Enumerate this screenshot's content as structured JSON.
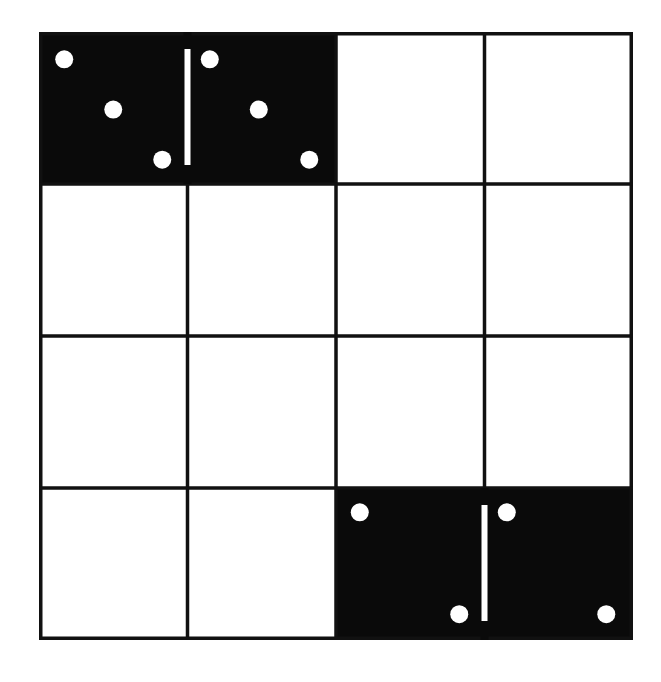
{
  "board": {
    "title": "",
    "rows": 4,
    "cols": 4,
    "colors": {
      "background": "#ffffff",
      "grid_line": "#111111",
      "domino_fill": "#0a0a0a",
      "pip": "#ffffff",
      "divider": "#ffffff"
    },
    "dominoes": [
      {
        "name": "domino-3-3",
        "row": 0,
        "col_start": 0,
        "col_end": 1,
        "halves": [
          {
            "value": 3,
            "pips": [
              [
                0.17,
                0.18
              ],
              [
                0.5,
                0.51
              ],
              [
                0.83,
                0.84
              ]
            ]
          },
          {
            "value": 3,
            "pips": [
              [
                0.15,
                0.18
              ],
              [
                0.48,
                0.51
              ],
              [
                0.82,
                0.84
              ]
            ]
          }
        ]
      },
      {
        "name": "domino-2-2",
        "row": 3,
        "col_start": 2,
        "col_end": 3,
        "halves": [
          {
            "value": 2,
            "pips": [
              [
                0.16,
                0.16
              ],
              [
                0.83,
                0.83
              ]
            ]
          },
          {
            "value": 2,
            "pips": [
              [
                0.15,
                0.16
              ],
              [
                0.82,
                0.83
              ]
            ]
          }
        ]
      }
    ]
  }
}
